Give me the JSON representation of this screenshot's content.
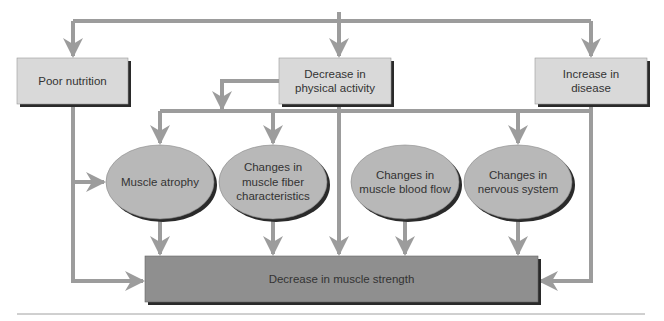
{
  "diagram": {
    "colors": {
      "background": "#ffffff",
      "arrow": "#9c9c9c",
      "cause_box_fill": "#d9d9d9",
      "mechanism_ellipse_fill": "#b8b8b8",
      "outcome_box_fill": "#8f8f8f",
      "shadow": "#2a2a2a",
      "text": "#333333",
      "divider": "#a0a0a0"
    },
    "causes": [
      {
        "id": "poor-nutrition",
        "label": "Poor nutrition"
      },
      {
        "id": "decrease-physical-activity",
        "label": "Decrease in\nphysical activity"
      },
      {
        "id": "increase-disease",
        "label": "Increase in\ndisease"
      }
    ],
    "mechanisms": [
      {
        "id": "muscle-atrophy",
        "label": "Muscle atrophy"
      },
      {
        "id": "muscle-fiber-changes",
        "label": "Changes in\nmuscle fiber\ncharacteristics"
      },
      {
        "id": "blood-flow-changes",
        "label": "Changes in\nmuscle blood flow"
      },
      {
        "id": "nervous-system-changes",
        "label": "Changes in\nnervous system"
      }
    ],
    "outcome": {
      "id": "decrease-muscle-strength",
      "label": "Decrease in muscle strength"
    }
  }
}
